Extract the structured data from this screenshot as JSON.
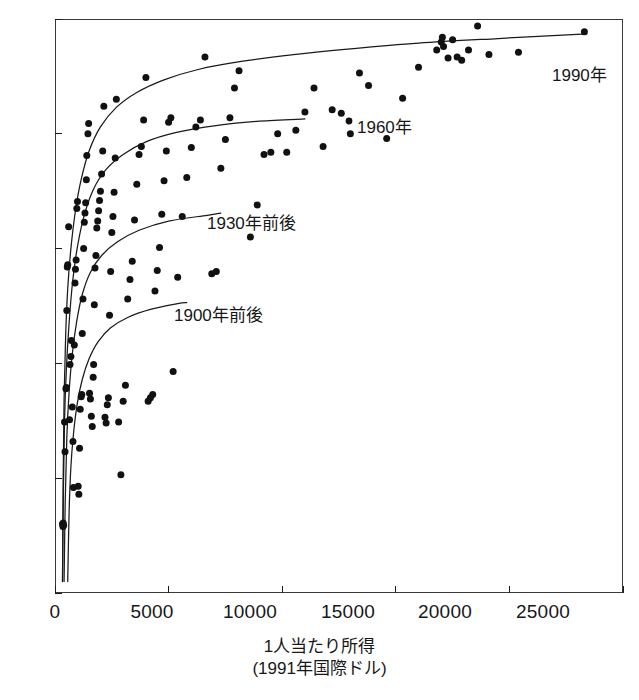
{
  "chart_data": {
    "type": "scatter",
    "title": "",
    "xlabel": "1人当たり所得",
    "xlabel_sub": "(1991年国際ドル)",
    "ylabel": "",
    "xlim": [
      0,
      25000
    ],
    "ylim": [
      30,
      80
    ],
    "grid": false,
    "legend_position": "inline-annotations",
    "xticks": [
      0,
      5000,
      10000,
      15000,
      20000,
      25000
    ],
    "xtick_labels": [
      "0",
      "5000",
      "10000",
      "15000",
      "20000",
      "25000"
    ],
    "yticks": [
      30,
      40,
      50,
      60,
      70,
      80
    ],
    "ytick_labels": [
      "30",
      "40",
      "50",
      "60",
      "70",
      "80"
    ],
    "marker": {
      "shape": "circle",
      "color": "#111111",
      "size_px": 7
    },
    "annotations": [
      {
        "name": "label-1990",
        "text": "1990年",
        "x": 20600,
        "y": 74.3
      },
      {
        "name": "label-1960",
        "text": "1960年",
        "x": 13000,
        "y": 70.9
      },
      {
        "name": "label-1930",
        "text": "1930年前後",
        "x": 7850,
        "y": 62.6
      },
      {
        "name": "label-1900",
        "text": "1900年前後",
        "x": 6150,
        "y": 54.6
      }
    ],
    "series": [
      {
        "name": "1990年",
        "type": "line",
        "label": "1990年",
        "color": "#1a1a1a",
        "points": [
          [
            330,
            31.0
          ],
          [
            360,
            40.0
          ],
          [
            400,
            47.0
          ],
          [
            470,
            52.5
          ],
          [
            560,
            56.5
          ],
          [
            700,
            60.0
          ],
          [
            900,
            63.3
          ],
          [
            1150,
            66.0
          ],
          [
            1500,
            68.5
          ],
          [
            2000,
            70.6
          ],
          [
            2700,
            72.3
          ],
          [
            3600,
            73.6
          ],
          [
            4800,
            74.7
          ],
          [
            6300,
            75.6
          ],
          [
            8200,
            76.3
          ],
          [
            10500,
            76.9
          ],
          [
            13000,
            77.4
          ],
          [
            16000,
            77.9
          ],
          [
            19500,
            78.3
          ],
          [
            23400,
            78.7
          ]
        ]
      },
      {
        "name": "1960年",
        "type": "line",
        "label": "1960年",
        "color": "#1a1a1a",
        "points": [
          [
            330,
            31.0
          ],
          [
            370,
            39.0
          ],
          [
            420,
            45.0
          ],
          [
            500,
            49.5
          ],
          [
            620,
            53.5
          ],
          [
            780,
            57.2
          ],
          [
            1000,
            60.3
          ],
          [
            1300,
            63.0
          ],
          [
            1700,
            65.2
          ],
          [
            2250,
            66.9
          ],
          [
            3000,
            68.2
          ],
          [
            4000,
            69.3
          ],
          [
            5300,
            70.1
          ],
          [
            7000,
            70.7
          ],
          [
            9000,
            71.1
          ],
          [
            11000,
            71.3
          ]
        ]
      },
      {
        "name": "1930年前後",
        "type": "line",
        "label": "1930年前後",
        "color": "#1a1a1a",
        "points": [
          [
            400,
            31.0
          ],
          [
            450,
            38.0
          ],
          [
            520,
            43.5
          ],
          [
            620,
            47.5
          ],
          [
            760,
            50.8
          ],
          [
            950,
            53.6
          ],
          [
            1200,
            56.0
          ],
          [
            1550,
            57.9
          ],
          [
            2050,
            59.4
          ],
          [
            2750,
            60.6
          ],
          [
            3700,
            61.6
          ],
          [
            5000,
            62.4
          ],
          [
            6700,
            62.9
          ],
          [
            7300,
            63.1
          ]
        ]
      },
      {
        "name": "1900年前後",
        "type": "line",
        "label": "1900年前後",
        "color": "#1a1a1a",
        "points": [
          [
            560,
            31.0
          ],
          [
            620,
            37.0
          ],
          [
            700,
            41.0
          ],
          [
            820,
            44.0
          ],
          [
            980,
            46.5
          ],
          [
            1200,
            48.6
          ],
          [
            1500,
            50.4
          ],
          [
            1900,
            51.9
          ],
          [
            2450,
            53.1
          ],
          [
            3200,
            54.0
          ],
          [
            4200,
            54.7
          ],
          [
            5400,
            55.2
          ],
          [
            5800,
            55.3
          ]
        ]
      },
      {
        "name": "1990年 scatter",
        "type": "scatter",
        "points": [
          [
            330,
            36.0
          ],
          [
            350,
            35.8
          ],
          [
            360,
            36.1
          ],
          [
            380,
            35.9
          ],
          [
            420,
            44.9
          ],
          [
            440,
            42.3
          ],
          [
            480,
            47.8
          ],
          [
            500,
            47.9
          ],
          [
            520,
            54.6
          ],
          [
            540,
            58.4
          ],
          [
            560,
            58.6
          ],
          [
            600,
            61.9
          ],
          [
            640,
            45.1
          ],
          [
            660,
            49.9
          ],
          [
            700,
            50.6
          ],
          [
            720,
            52.0
          ],
          [
            760,
            46.2
          ],
          [
            790,
            43.2
          ],
          [
            810,
            39.2
          ],
          [
            850,
            51.6
          ],
          [
            880,
            57.0
          ],
          [
            900,
            58.2
          ],
          [
            930,
            59.0
          ],
          [
            960,
            63.5
          ],
          [
            990,
            64.1
          ],
          [
            1020,
            39.3
          ],
          [
            1050,
            38.6
          ],
          [
            1080,
            42.6
          ],
          [
            1110,
            46.0
          ],
          [
            1150,
            47.1
          ],
          [
            1180,
            47.3
          ],
          [
            1200,
            52.6
          ],
          [
            1230,
            55.6
          ],
          [
            1260,
            60.0
          ],
          [
            1290,
            62.3
          ],
          [
            1320,
            63.1
          ],
          [
            1350,
            64.0
          ],
          [
            1380,
            66.0
          ],
          [
            1400,
            68.1
          ],
          [
            1450,
            70.0
          ],
          [
            1480,
            70.9
          ],
          [
            1520,
            47.4
          ],
          [
            1560,
            46.9
          ],
          [
            1600,
            45.4
          ],
          [
            1640,
            44.5
          ],
          [
            1680,
            48.8
          ],
          [
            1700,
            49.9
          ],
          [
            1730,
            55.1
          ],
          [
            1760,
            58.3
          ],
          [
            1800,
            59.4
          ],
          [
            1840,
            61.8
          ],
          [
            1880,
            62.4
          ],
          [
            1920,
            63.3
          ],
          [
            1960,
            64.2
          ],
          [
            2000,
            65.0
          ],
          [
            2050,
            66.5
          ],
          [
            2100,
            68.5
          ],
          [
            2150,
            72.4
          ],
          [
            2200,
            45.3
          ],
          [
            2250,
            44.8
          ],
          [
            2300,
            46.4
          ],
          [
            2350,
            47.0
          ],
          [
            2400,
            54.2
          ],
          [
            2450,
            58.0
          ],
          [
            2500,
            61.4
          ],
          [
            2550,
            62.8
          ],
          [
            2600,
            64.9
          ],
          [
            2650,
            67.9
          ],
          [
            2700,
            73.0
          ],
          [
            2800,
            44.9
          ],
          [
            2900,
            40.3
          ],
          [
            3000,
            46.7
          ],
          [
            3100,
            48.1
          ],
          [
            3200,
            55.6
          ],
          [
            3300,
            57.3
          ],
          [
            3400,
            58.9
          ],
          [
            3500,
            62.5
          ],
          [
            3600,
            65.6
          ],
          [
            3700,
            68.2
          ],
          [
            3800,
            68.9
          ],
          [
            3900,
            71.2
          ],
          [
            4000,
            74.9
          ],
          [
            4100,
            46.7
          ],
          [
            4200,
            47.0
          ],
          [
            4300,
            47.3
          ],
          [
            4400,
            56.3
          ],
          [
            4500,
            58.1
          ],
          [
            4600,
            60.1
          ],
          [
            4700,
            63.0
          ],
          [
            4800,
            65.9
          ],
          [
            4900,
            68.5
          ],
          [
            5000,
            71.0
          ],
          [
            5100,
            71.4
          ],
          [
            5200,
            49.3
          ],
          [
            5400,
            57.5
          ],
          [
            5600,
            62.8
          ],
          [
            5800,
            66.2
          ],
          [
            6000,
            68.8
          ],
          [
            6200,
            70.6
          ],
          [
            6400,
            71.2
          ],
          [
            6600,
            76.7
          ],
          [
            6900,
            57.8
          ],
          [
            7100,
            58.0
          ],
          [
            7300,
            67.0
          ],
          [
            7500,
            69.5
          ],
          [
            7700,
            71.4
          ],
          [
            7900,
            74.0
          ],
          [
            8100,
            75.5
          ],
          [
            8600,
            61.0
          ],
          [
            8900,
            63.8
          ],
          [
            9200,
            68.2
          ],
          [
            9500,
            68.4
          ],
          [
            9800,
            70.0
          ],
          [
            10200,
            68.4
          ],
          [
            10600,
            70.3
          ],
          [
            11000,
            71.9
          ],
          [
            11400,
            74.0
          ],
          [
            11800,
            68.9
          ],
          [
            12200,
            72.1
          ],
          [
            12600,
            71.8
          ],
          [
            13000,
            70.0
          ],
          [
            13400,
            75.3
          ],
          [
            13800,
            74.2
          ],
          [
            14600,
            69.6
          ],
          [
            15300,
            73.1
          ],
          [
            16000,
            75.8
          ],
          [
            16800,
            77.3
          ],
          [
            17000,
            78.0
          ],
          [
            17050,
            78.4
          ],
          [
            17100,
            77.6
          ],
          [
            17300,
            76.6
          ],
          [
            17500,
            78.2
          ],
          [
            17700,
            76.7
          ],
          [
            17900,
            76.4
          ],
          [
            18200,
            77.3
          ],
          [
            18600,
            79.4
          ],
          [
            19100,
            76.9
          ],
          [
            20400,
            77.1
          ],
          [
            23300,
            78.9
          ]
        ]
      }
    ]
  },
  "axis": {
    "y_tick_labels": [
      "80",
      "70",
      "60",
      "50",
      "40",
      "30"
    ],
    "x_tick_labels": [
      "0",
      "5000",
      "10000",
      "15000",
      "20000",
      "25000"
    ]
  },
  "labels": {
    "l1990": "1990年",
    "l1960": "1960年",
    "l1930": "1930年前後",
    "l1900": "1900年前後",
    "x_title_main": "1人当たり所得",
    "x_title_sub": "(1991年国際ドル)"
  },
  "colors": {
    "ink": "#1a1a1a",
    "marker": "#111111",
    "frame": "#3a3a3a",
    "background": "#ffffff"
  }
}
